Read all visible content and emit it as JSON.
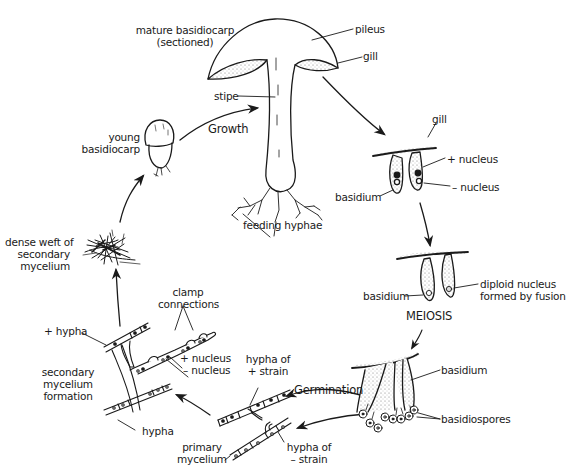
{
  "diagram": {
    "type": "cycle",
    "stages": [
      {
        "id": "mature",
        "label_lines": [
          "mature basidiocarp",
          "(sectioned)"
        ]
      },
      {
        "id": "gill-section",
        "label": "gill"
      },
      {
        "id": "binucleate-basidium"
      },
      {
        "id": "diploid-basidium"
      },
      {
        "id": "meiosis",
        "label": "MEIOSIS"
      },
      {
        "id": "spores"
      },
      {
        "id": "primary-mycelium",
        "label_lines": [
          "primary",
          "mycelium"
        ]
      },
      {
        "id": "secondary-mycelium",
        "label_lines": [
          "secondary",
          "mycelium",
          "formation"
        ]
      },
      {
        "id": "weft",
        "label_lines": [
          "dense weft of",
          "secondary",
          "mycelium"
        ]
      },
      {
        "id": "young",
        "label_lines": [
          "young",
          "basidiocarp"
        ]
      }
    ],
    "labels": {
      "mature_1": "mature basidiocarp",
      "mature_2": "(sectioned)",
      "pileus": "pileus",
      "gill_top": "gill",
      "stipe": "stipe",
      "growth": "Growth",
      "feeding_hyphae": "feeding hyphae",
      "young_1": "young",
      "young_2": "basidiocarp",
      "gill_section": "gill",
      "plus_nucleus": "+ nucleus",
      "minus_nucleus": "– nucleus",
      "basidium_1": "basidium",
      "basidium_2": "basidium",
      "diploid_1": "diploid nucleus",
      "diploid_2": "formed by fusion",
      "meiosis": "MEIOSIS",
      "basidium_3": "basidium",
      "basidiospores": "basidiospores",
      "germination": "Germination",
      "hypha_plus_1": "hypha of",
      "hypha_plus_2": "+ strain",
      "hypha_minus_1": "hypha of",
      "hypha_minus_2": "– strain",
      "primary_1": "primary",
      "primary_2": "mycelium",
      "plus_hypha": "+ hypha",
      "clamp_1": "clamp",
      "clamp_2": "connections",
      "sec_plus_nucleus": "+ nucleus",
      "sec_minus_nucleus": "– nucleus",
      "secondary_1": "secondary",
      "secondary_2": "mycelium",
      "secondary_3": "formation",
      "hypha": "hypha",
      "weft_1": "dense weft of",
      "weft_2": "secondary",
      "weft_3": "mycelium"
    },
    "colors": {
      "ink": "#1a1a1a",
      "stipple": "#bdbdbd",
      "background": "#ffffff"
    }
  }
}
